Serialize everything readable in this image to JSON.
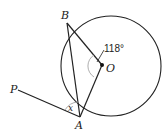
{
  "diagram": {
    "type": "geometry",
    "labels": {
      "B": "B",
      "O": "O",
      "A": "A",
      "P": "P",
      "x": "x",
      "angle_BOA": "118°"
    },
    "colors": {
      "line": "#222222",
      "arc": "#999999"
    }
  }
}
